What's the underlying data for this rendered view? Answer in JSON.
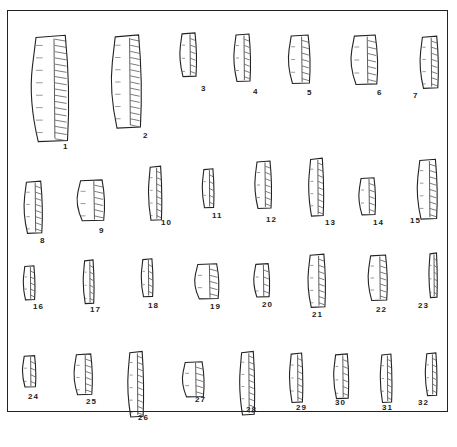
{
  "figure": {
    "artifacts": [
      {
        "n": "1",
        "x": 27,
        "y": 33,
        "w": 45,
        "h": 112,
        "lx": 63,
        "ly": 142
      },
      {
        "n": "2",
        "x": 108,
        "y": 33,
        "w": 36,
        "h": 98,
        "lx": 143,
        "ly": 131
      },
      {
        "n": "3",
        "x": 178,
        "y": 32,
        "w": 20,
        "h": 46,
        "lx": 201,
        "ly": 84
      },
      {
        "n": "4",
        "x": 232,
        "y": 33,
        "w": 20,
        "h": 50,
        "lx": 253,
        "ly": 87
      },
      {
        "n": "5",
        "x": 286,
        "y": 34,
        "w": 26,
        "h": 51,
        "lx": 307,
        "ly": 88
      },
      {
        "n": "6",
        "x": 348,
        "y": 34,
        "w": 32,
        "h": 52,
        "lx": 377,
        "ly": 88
      },
      {
        "n": "7",
        "x": 418,
        "y": 35,
        "w": 22,
        "h": 55,
        "lx": 413,
        "ly": 91
      },
      {
        "n": "8",
        "x": 22,
        "y": 180,
        "w": 22,
        "h": 55,
        "lx": 40,
        "ly": 236
      },
      {
        "n": "9",
        "x": 74,
        "y": 179,
        "w": 33,
        "h": 43,
        "lx": 99,
        "ly": 226
      },
      {
        "n": "10",
        "x": 147,
        "y": 165,
        "w": 16,
        "h": 57,
        "lx": 161,
        "ly": 218
      },
      {
        "n": "11",
        "x": 201,
        "y": 168,
        "w": 14,
        "h": 41,
        "lx": 212,
        "ly": 211
      },
      {
        "n": "12",
        "x": 253,
        "y": 160,
        "w": 20,
        "h": 50,
        "lx": 266,
        "ly": 215
      },
      {
        "n": "13",
        "x": 307,
        "y": 157,
        "w": 18,
        "h": 61,
        "lx": 325,
        "ly": 218
      },
      {
        "n": "14",
        "x": 357,
        "y": 177,
        "w": 20,
        "h": 39,
        "lx": 373,
        "ly": 218
      },
      {
        "n": "15",
        "x": 415,
        "y": 158,
        "w": 24,
        "h": 63,
        "lx": 410,
        "ly": 216
      },
      {
        "n": "16",
        "x": 22,
        "y": 265,
        "w": 14,
        "h": 36,
        "lx": 33,
        "ly": 302
      },
      {
        "n": "17",
        "x": 82,
        "y": 259,
        "w": 13,
        "h": 46,
        "lx": 90,
        "ly": 305
      },
      {
        "n": "18",
        "x": 140,
        "y": 258,
        "w": 14,
        "h": 40,
        "lx": 148,
        "ly": 301
      },
      {
        "n": "19",
        "x": 192,
        "y": 263,
        "w": 29,
        "h": 37,
        "lx": 210,
        "ly": 302
      },
      {
        "n": "20",
        "x": 252,
        "y": 263,
        "w": 19,
        "h": 35,
        "lx": 262,
        "ly": 300
      },
      {
        "n": "21",
        "x": 306,
        "y": 253,
        "w": 21,
        "h": 56,
        "lx": 312,
        "ly": 310
      },
      {
        "n": "22",
        "x": 366,
        "y": 254,
        "w": 23,
        "h": 48,
        "lx": 376,
        "ly": 305
      },
      {
        "n": "23",
        "x": 428,
        "y": 252,
        "w": 10,
        "h": 47,
        "lx": 418,
        "ly": 301
      },
      {
        "n": "24",
        "x": 21,
        "y": 355,
        "w": 16,
        "h": 33,
        "lx": 28,
        "ly": 392
      },
      {
        "n": "25",
        "x": 72,
        "y": 353,
        "w": 22,
        "h": 43,
        "lx": 86,
        "ly": 397
      },
      {
        "n": "26",
        "x": 126,
        "y": 350,
        "w": 19,
        "h": 69,
        "lx": 138,
        "ly": 413
      },
      {
        "n": "27",
        "x": 180,
        "y": 361,
        "w": 26,
        "h": 37,
        "lx": 195,
        "ly": 395
      },
      {
        "n": "28",
        "x": 238,
        "y": 350,
        "w": 18,
        "h": 67,
        "lx": 246,
        "ly": 405
      },
      {
        "n": "29",
        "x": 288,
        "y": 352,
        "w": 16,
        "h": 52,
        "lx": 296,
        "ly": 403
      },
      {
        "n": "30",
        "x": 332,
        "y": 353,
        "w": 18,
        "h": 47,
        "lx": 335,
        "ly": 398
      },
      {
        "n": "31",
        "x": 379,
        "y": 353,
        "w": 14,
        "h": 51,
        "lx": 382,
        "ly": 403
      },
      {
        "n": "32",
        "x": 424,
        "y": 352,
        "w": 14,
        "h": 45,
        "lx": 418,
        "ly": 398
      }
    ]
  }
}
